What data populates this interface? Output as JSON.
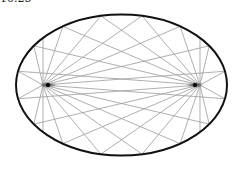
{
  "figure": {
    "label": "10.25"
  },
  "ellipse": {
    "cx": 121.5,
    "cy": 85,
    "rx": 105.5,
    "ry": 70.5,
    "stroke": "#111111",
    "stroke_width": 2
  },
  "foci": [
    {
      "name": "left-focus",
      "x": 48,
      "y": 85
    },
    {
      "name": "right-focus",
      "x": 195,
      "y": 85
    }
  ],
  "rays": {
    "count": 16,
    "color": "#9a9a9a",
    "width": 0.8
  },
  "colors": {
    "focus": "#000000",
    "background": "#ffffff"
  }
}
